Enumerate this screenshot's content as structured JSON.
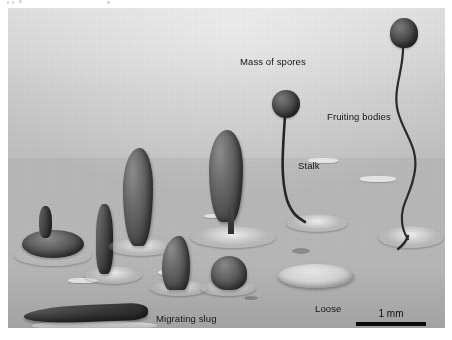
{
  "figure": {
    "kind": "scanning-electron-micrograph"
  },
  "labels": {
    "mass_of_spores": "Mass of spores",
    "fruiting_bodies": "Fruiting bodies",
    "stalk": "Stalk",
    "migrating_slug": "Migrating slug",
    "loose_aggregation_line1": "Loose",
    "loose_aggregation_line2": "aggregation",
    "loose_aggregation_line3": "of cells"
  },
  "scale_bar": {
    "value": "1 mm"
  },
  "colors": {
    "background_light": "#cfcfcf",
    "background_dark": "#b3b3b3",
    "specimen_dark": "#3a3a3a",
    "label_text": "#141414",
    "scale_bar": "#0b0b0b",
    "page": "#ffffff"
  }
}
